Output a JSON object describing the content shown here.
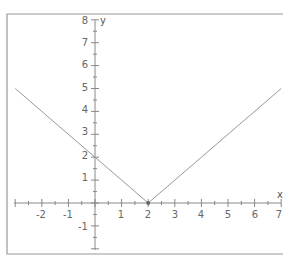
{
  "chart_data": {
    "type": "line",
    "title": "",
    "function": "y = |x - 2|",
    "xlabel": "x",
    "ylabel": "y",
    "xlim": [
      -3,
      7
    ],
    "ylim": [
      -2,
      8
    ],
    "x_ticks": [
      -2,
      -1,
      1,
      2,
      3,
      4,
      5,
      6,
      7
    ],
    "y_ticks": [
      -1,
      1,
      2,
      3,
      4,
      5,
      6,
      7,
      8
    ],
    "grid": false,
    "series": [
      {
        "name": "y = |x - 2|",
        "x": [
          -3,
          2,
          7
        ],
        "y": [
          5,
          0,
          5
        ]
      }
    ],
    "points": [
      {
        "x": 2,
        "y": 0,
        "marker": "dot"
      }
    ],
    "colors": {
      "line": "#999999",
      "axis": "#777777",
      "frame": "#888888"
    }
  },
  "labels": {
    "x_axis": "x",
    "y_axis": "y",
    "x_ticks": [
      "-2",
      "-1",
      "1",
      "2",
      "3",
      "4",
      "5",
      "6",
      "7"
    ],
    "y_ticks": [
      "8",
      "7",
      "6",
      "5",
      "4",
      "3",
      "2",
      "1",
      "-1"
    ]
  }
}
